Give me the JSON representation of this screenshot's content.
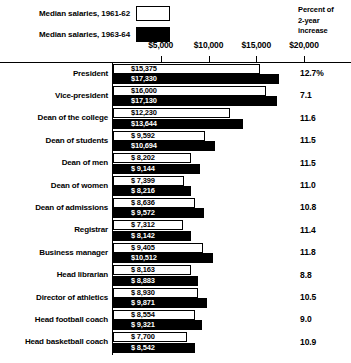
{
  "legend": {
    "items": [
      {
        "label": "Median salaries, 1961-62",
        "swatch": "white",
        "swatch_color": "#ffffff"
      },
      {
        "label": "Median salaries, 1963-64",
        "swatch": "black",
        "swatch_color": "#000000"
      }
    ]
  },
  "percent_header": {
    "line1": "Percent of",
    "line2": "2-year",
    "line3": "increase"
  },
  "axis": {
    "tick_labels": [
      "$5,000",
      "$10,000",
      "$15,000",
      "$20,000"
    ],
    "tick_values": [
      5000,
      10000,
      15000,
      20000
    ]
  },
  "chart_data": {
    "type": "bar",
    "orientation": "horizontal",
    "title": "",
    "subtitle": "",
    "xlabel": "",
    "ylabel": "",
    "xlim": [
      0,
      20000
    ],
    "grid": false,
    "legend_position": "top-left",
    "categories": [
      "President",
      "Vice-president",
      "Dean of the college",
      "Dean of students",
      "Dean of men",
      "Dean of women",
      "Dean of admissions",
      "Registrar",
      "Business manager",
      "Head librarian",
      "Director of athletics",
      "Head football coach",
      "Head basketball coach"
    ],
    "series": [
      {
        "name": "Median salaries, 1961-62",
        "color": "#ffffff",
        "values": [
          15375,
          16000,
          12230,
          9592,
          8202,
          7399,
          8636,
          7312,
          9405,
          8163,
          8930,
          8554,
          7700
        ],
        "labels": [
          "$15,375",
          "$16,000",
          "$12,230",
          "$ 9,592",
          "$ 8,202",
          "$ 7,399",
          "$ 8,636",
          "$ 7,312",
          "$ 9,405",
          "$ 8,163",
          "$ 8,930",
          "$ 8,554",
          "$ 7,700"
        ]
      },
      {
        "name": "Median salaries, 1963-64",
        "color": "#000000",
        "values": [
          17330,
          17130,
          13644,
          10694,
          9144,
          8216,
          9572,
          8142,
          10512,
          8883,
          9871,
          9321,
          8542
        ],
        "labels": [
          "$17,330",
          "$17,130",
          "$13,644",
          "$10,694",
          "$ 9,144",
          "$ 8,216",
          "$ 9,572",
          "$ 8,142",
          "$10,512",
          "$ 8,883",
          "$ 9,871",
          "$ 9,321",
          "$ 8,542"
        ]
      }
    ],
    "percent_increase": [
      "12.7%",
      "7.1",
      "11.6",
      "11.5",
      "11.5",
      "11.0",
      "10.8",
      "11.4",
      "11.8",
      "8.8",
      "10.5",
      "9.0",
      "10.9"
    ]
  }
}
